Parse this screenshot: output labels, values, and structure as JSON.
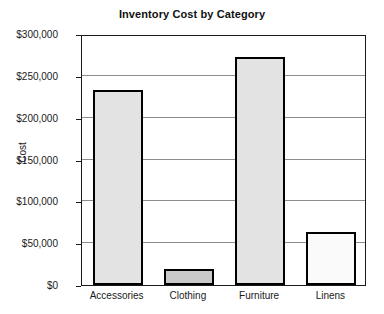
{
  "chart_data": {
    "type": "bar",
    "title": "Inventory Cost by Category",
    "xlabel": "",
    "ylabel": "Cost",
    "categories": [
      "Accessories",
      "Clothing",
      "Furniture",
      "Linens"
    ],
    "values": [
      233000,
      19000,
      272000,
      63000
    ],
    "ylim": [
      0,
      300000
    ],
    "y_ticks": [
      0,
      50000,
      100000,
      150000,
      200000,
      250000,
      300000
    ],
    "y_tick_labels": [
      "$0",
      "$50,000",
      "$100,000",
      "$150,000",
      "$200,000",
      "$250,000",
      "$300,000"
    ],
    "grid": true,
    "legend": false,
    "bar_colors": [
      "#e3e3e3",
      "#c9c9c9",
      "#e3e3e3",
      "#fafafa"
    ],
    "bar_edge_color": "#000000",
    "grid_color": "#8c8c8c",
    "axis_color": "#1a1a1a",
    "background_color": "#ffffff"
  }
}
